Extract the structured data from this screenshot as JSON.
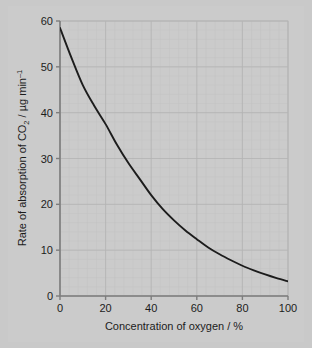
{
  "figure": {
    "background_color": "#c9c9c9",
    "panel_color": "#cbcbcb",
    "grid_color": "#bdbdbd",
    "grid_major_color": "#b0b0b0",
    "axis_color": "#808080",
    "curve_color": "#1c1c1c"
  },
  "chart_data": {
    "type": "line",
    "title": "",
    "xlabel": "Concentration of oxygen / %",
    "ylabel_parts": {
      "lead": "Rate of absorption of CO",
      "sub": "2",
      "mid": " / µg min",
      "sup": "–1"
    },
    "ylabel": "Rate of absorption of CO2 / µg min-1",
    "xlim": [
      0,
      100
    ],
    "ylim": [
      0,
      60
    ],
    "xticks": [
      0,
      20,
      40,
      60,
      80,
      100
    ],
    "yticks": [
      0,
      10,
      20,
      30,
      40,
      50,
      60
    ],
    "xtick_labels": [
      "0",
      "20",
      "40",
      "60",
      "80",
      "100"
    ],
    "ytick_labels": [
      "0",
      "10",
      "20",
      "30",
      "40",
      "50",
      "60"
    ],
    "x_minor_step": 4,
    "y_minor_step": 2,
    "grid": true,
    "legend": false,
    "series": [
      {
        "name": "Rate of absorption of CO2",
        "x": [
          0,
          5,
          10,
          15,
          20,
          25,
          30,
          35,
          40,
          45,
          50,
          55,
          60,
          65,
          70,
          75,
          80,
          85,
          90,
          95,
          100
        ],
        "y": [
          58.5,
          52.0,
          46.0,
          41.5,
          37.5,
          33.0,
          29.0,
          25.5,
          22.0,
          19.0,
          16.5,
          14.3,
          12.4,
          10.6,
          9.1,
          7.8,
          6.6,
          5.6,
          4.7,
          3.9,
          3.2
        ]
      }
    ]
  }
}
